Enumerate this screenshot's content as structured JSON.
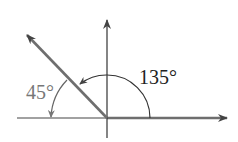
{
  "diagram": {
    "type": "angle-rotation",
    "labels": {
      "angle_large": "135°",
      "angle_small": "45°"
    },
    "angles_deg": {
      "counterclockwise_from_positive_x": 135,
      "clockwise_to_negative_x": 45
    },
    "colors": {
      "axis": "#333333",
      "terminal_ray": "#6e6e6e",
      "initial_ray": "#6e6e6e",
      "label_135": "#222222",
      "label_45": "#777777",
      "background": "#ffffff"
    }
  }
}
